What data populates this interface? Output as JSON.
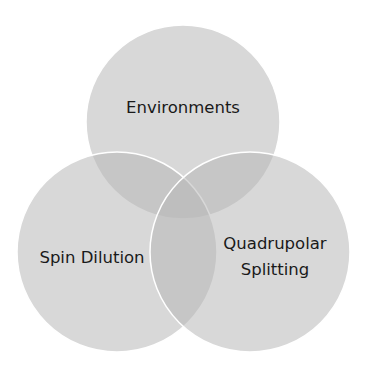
{
  "diagram": {
    "type": "venn",
    "circles": [
      {
        "id": "top",
        "label": "Environments",
        "cx": 183,
        "cy": 122,
        "r": 97
      },
      {
        "id": "left",
        "label": "Spin Dilution",
        "cx": 117,
        "cy": 252,
        "r": 100
      },
      {
        "id": "right",
        "label_line1": "Quadrupolar",
        "label_line2": "Splitting",
        "cx": 250,
        "cy": 252,
        "r": 100
      }
    ],
    "colors": {
      "fill": "#b8b8b8",
      "fill_opacity": "0.55",
      "stroke": "#ffffff",
      "text": "#1a1a1a"
    }
  }
}
